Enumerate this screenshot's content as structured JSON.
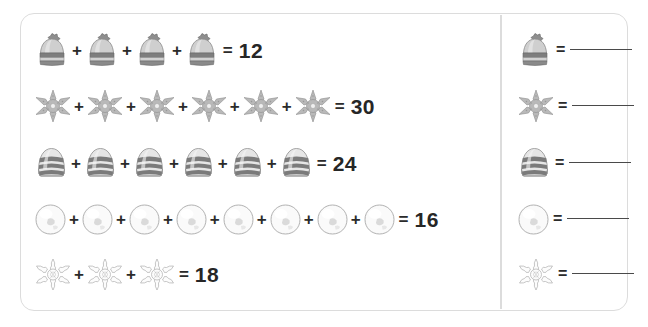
{
  "worksheet": {
    "title": "Winter picture addition worksheet",
    "operator_plus": "+",
    "operator_equals": "=",
    "answer_blank": ""
  },
  "equations": [
    {
      "id": "row-hat",
      "icon": "winter-hat-pompom-icon",
      "icon_label": "winter hat with pompom",
      "count": 4,
      "total": "12"
    },
    {
      "id": "row-glitter-snowflake",
      "icon": "glitter-snowflake-icon",
      "icon_label": "glitter snowflake ornament",
      "count": 6,
      "total": "30"
    },
    {
      "id": "row-striped-beanie",
      "icon": "striped-beanie-icon",
      "icon_label": "striped knit beanie",
      "count": 6,
      "total": "24"
    },
    {
      "id": "row-snowball",
      "icon": "snowball-icon",
      "icon_label": "snowball",
      "count": 8,
      "total": "16"
    },
    {
      "id": "row-white-snowflake",
      "icon": "white-snowflake-icon",
      "icon_label": "white fluffy snowflake",
      "count": 3,
      "total": "18"
    }
  ],
  "key": [
    {
      "id": "key-hat",
      "icon": "winter-hat-pompom-icon",
      "icon_label": "winter hat with pompom",
      "value": ""
    },
    {
      "id": "key-glitter-snowflake",
      "icon": "glitter-snowflake-icon",
      "icon_label": "glitter snowflake ornament",
      "value": ""
    },
    {
      "id": "key-striped-beanie",
      "icon": "striped-beanie-icon",
      "icon_label": "striped knit beanie",
      "value": ""
    },
    {
      "id": "key-snowball",
      "icon": "snowball-icon",
      "icon_label": "snowball",
      "value": ""
    },
    {
      "id": "key-white-snowflake",
      "icon": "white-snowflake-icon",
      "icon_label": "white fluffy snowflake",
      "value": ""
    }
  ],
  "colors": {
    "border": "#dcdcdc",
    "text": "#262626",
    "blank_line": "#4a4a4a",
    "icon_gray_dark": "#6e6e6e",
    "icon_gray_mid": "#9a9a9a",
    "icon_gray_light": "#d6d6d6"
  }
}
